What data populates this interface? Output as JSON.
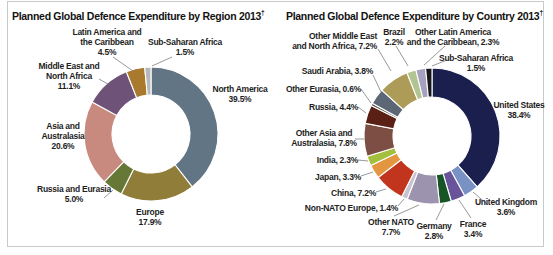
{
  "figure": {
    "background_color": "#ffffff",
    "border_color": "#c9c9c9",
    "label_text_color": "#1e1e1e",
    "leader_line_color": "#8d8d8d",
    "note_symbol": "†"
  },
  "chart_data": [
    {
      "type": "pie",
      "subtype": "donut",
      "title": "Planned Global Defence Expenditure by Region 2013",
      "title_note_symbol": "†",
      "legend_position": "none",
      "label_style": "outside-callouts",
      "categories": [
        "North America",
        "Europe",
        "Russia and Eurasia",
        "Asia and Australasia",
        "Middle East and North Africa",
        "Latin America and the Caribbean",
        "Sub-Saharan Africa"
      ],
      "values": [
        39.5,
        17.9,
        5.0,
        20.6,
        11.1,
        4.5,
        1.5
      ],
      "segments": [
        {
          "id": "north-america",
          "name": "North America",
          "value": 39.5,
          "color": "#627584",
          "label_lines": [
            "North America",
            "39.5%"
          ]
        },
        {
          "id": "europe",
          "name": "Europe",
          "value": 17.9,
          "color": "#907d39",
          "label_lines": [
            "Europe",
            "17.9%"
          ]
        },
        {
          "id": "russia-eurasia",
          "name": "Russia and Eurasia",
          "value": 5.0,
          "color": "#667836",
          "label_lines": [
            "Russia and Eurasia",
            "5.0%"
          ]
        },
        {
          "id": "asia-australasia",
          "name": "Asia and Australasia",
          "value": 20.6,
          "color": "#c8897e",
          "label_lines": [
            "Asia and",
            "Australasia",
            "20.6%"
          ]
        },
        {
          "id": "mena",
          "name": "Middle East and North Africa",
          "value": 11.1,
          "color": "#6f5278",
          "label_lines": [
            "Middle East and",
            "North Africa",
            "11.1%"
          ]
        },
        {
          "id": "latin-america",
          "name": "Latin America and the Caribbean",
          "value": 4.5,
          "color": "#a97a2d",
          "label_lines": [
            "Latin America and",
            "the Caribbean",
            "4.5%"
          ]
        },
        {
          "id": "sub-saharan-africa",
          "name": "Sub-Saharan Africa",
          "value": 1.5,
          "color": "#b6b9bb",
          "label_lines": [
            "Sub-Saharan Africa",
            "1.5%"
          ]
        }
      ]
    },
    {
      "type": "pie",
      "subtype": "donut",
      "title": "Planned Global Defence Expenditure by Country 2013",
      "title_note_symbol": "†",
      "legend_position": "none",
      "label_style": "outside-callouts",
      "categories": [
        "United States",
        "United Kingdom",
        "France",
        "Germany",
        "Other NATO",
        "Non-NATO Europe",
        "China",
        "Japan",
        "India",
        "Other Asia and Australasia",
        "Russia",
        "Other Eurasia",
        "Saudi Arabia",
        "Other Middle East and North Africa",
        "Brazil",
        "Other Latin America and the Caribbean",
        "Sub-Saharan Africa"
      ],
      "values": [
        38.4,
        3.6,
        3.4,
        2.8,
        7.7,
        1.4,
        7.2,
        3.3,
        2.3,
        7.8,
        4.4,
        0.6,
        3.8,
        7.2,
        2.2,
        2.3,
        1.5
      ],
      "segments": [
        {
          "id": "united-states",
          "name": "United States",
          "value": 38.4,
          "color": "#1b1f4e",
          "label_lines": [
            "United States",
            "38.4%"
          ]
        },
        {
          "id": "united-kingdom",
          "name": "United Kingdom",
          "value": 3.6,
          "color": "#7792c3",
          "label_lines": [
            "United Kingdom",
            "3.6%"
          ]
        },
        {
          "id": "france",
          "name": "France",
          "value": 3.4,
          "color": "#69549b",
          "label_lines": [
            "France",
            "3.4%"
          ]
        },
        {
          "id": "germany",
          "name": "Germany",
          "value": 2.8,
          "color": "#175426",
          "label_lines": [
            "Germany",
            "2.8%"
          ]
        },
        {
          "id": "other-nato",
          "name": "Other NATO",
          "value": 7.7,
          "color": "#9c93af",
          "label_lines": [
            "Other NATO",
            "7.7%"
          ]
        },
        {
          "id": "non-nato-europe",
          "name": "Non-NATO Europe",
          "value": 1.4,
          "color": "#c7c3d1",
          "label_lines": [
            "Non-NATO Europe, 1.4%"
          ]
        },
        {
          "id": "china",
          "name": "China",
          "value": 7.2,
          "color": "#c1351f",
          "label_lines": [
            "China, 7.2%"
          ]
        },
        {
          "id": "japan",
          "name": "Japan",
          "value": 3.3,
          "color": "#e3953f",
          "label_lines": [
            "Japan, 3.3%"
          ]
        },
        {
          "id": "india",
          "name": "India",
          "value": 2.3,
          "color": "#a3bf3d",
          "label_lines": [
            "India, 2.3%"
          ]
        },
        {
          "id": "other-asia",
          "name": "Other Asia and Australasia",
          "value": 7.8,
          "color": "#7d4e43",
          "label_lines": [
            "Other Asia and",
            "Australasia, 7.8%"
          ]
        },
        {
          "id": "russia",
          "name": "Russia",
          "value": 4.4,
          "color": "#5a2015",
          "label_lines": [
            "Russia, 4.4%"
          ]
        },
        {
          "id": "other-eurasia",
          "name": "Other Eurasia",
          "value": 0.6,
          "color": "#4f5347",
          "label_lines": [
            "Other Eurasia, 0.6%"
          ]
        },
        {
          "id": "saudi-arabia",
          "name": "Saudi Arabia",
          "value": 3.8,
          "color": "#5c6675",
          "label_lines": [
            "Saudi Arabia, 3.8%"
          ]
        },
        {
          "id": "other-mena",
          "name": "Other Middle East and North Africa",
          "value": 7.2,
          "color": "#ad9b58",
          "label_lines": [
            "Other Middle East",
            "and North Africa, 7.2%"
          ]
        },
        {
          "id": "brazil",
          "name": "Brazil",
          "value": 2.2,
          "color": "#b3c493",
          "label_lines": [
            "Brazil",
            "2.2%"
          ]
        },
        {
          "id": "other-latam",
          "name": "Other Latin America and the Caribbean",
          "value": 2.3,
          "color": "#a7a1c0",
          "label_lines": [
            "Other Latin America",
            "and the Caribbean, 2.3%"
          ]
        },
        {
          "id": "sub-saharan-africa-2",
          "name": "Sub-Saharan Africa",
          "value": 1.5,
          "color": "#17171c",
          "label_lines": [
            "Sub-Saharan Africa",
            "1.5%"
          ]
        }
      ]
    }
  ]
}
